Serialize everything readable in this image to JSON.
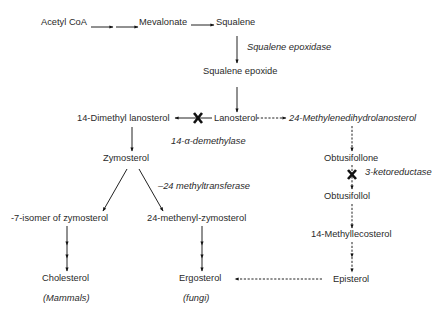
{
  "nodes": {
    "acetyl_coa": "Acetyl CoA",
    "mevalonate": "Mevalonate",
    "squalene": "Squalene",
    "squalene_epoxide": "Squalene epoxide",
    "lanosterol": "Lanosterol",
    "dimethyl_lanosterol": "14-Dimethyl lanosterol",
    "methylenedihydrolanosterol": "24-Methylenedihydrolanosterol",
    "zymosterol": "Zymosterol",
    "obtusifollone": "Obtusifollone",
    "obtusifollol": "Obtusifollol",
    "isomer_zymosterol": "-7-isomer of zymosterol",
    "methenyl_zymosterol": "24-methenyl-zymosterol",
    "methyllecosterol": "14-Methyllecosterol",
    "cholesterol": "Cholesterol",
    "ergosterol": "Ergosterol",
    "episterol": "Episterol"
  },
  "organisms": {
    "mammals": "(Mammals)",
    "fungi": "(fungi)"
  },
  "enzymes": {
    "squalene_epoxidase": "Squalene epoxidase",
    "demethylase": "14-α-demethylase",
    "methyltransferase": "–24 methyltransferase",
    "ketoreductase": "3-ketoreductase"
  },
  "edges": [
    {
      "from": "acetyl_coa",
      "to": "mevalonate",
      "style": "solid",
      "steps": 2
    },
    {
      "from": "mevalonate",
      "to": "squalene",
      "style": "solid"
    },
    {
      "from": "squalene",
      "to": "squalene_epoxide",
      "style": "solid",
      "enzyme": "squalene_epoxidase"
    },
    {
      "from": "squalene_epoxide",
      "to": "lanosterol",
      "style": "solid"
    },
    {
      "from": "lanosterol",
      "to": "dimethyl_lanosterol",
      "style": "solid",
      "enzyme": "demethylase",
      "blocked": true
    },
    {
      "from": "lanosterol",
      "to": "methylenedihydrolanosterol",
      "style": "dashed"
    },
    {
      "from": "dimethyl_lanosterol",
      "to": "zymosterol",
      "style": "solid"
    },
    {
      "from": "zymosterol",
      "to": "isomer_zymosterol",
      "style": "solid"
    },
    {
      "from": "zymosterol",
      "to": "methenyl_zymosterol",
      "style": "solid",
      "enzyme": "methyltransferase"
    },
    {
      "from": "isomer_zymosterol",
      "to": "cholesterol",
      "style": "solid",
      "steps": 3
    },
    {
      "from": "methenyl_zymosterol",
      "to": "ergosterol",
      "style": "solid",
      "steps": 3
    },
    {
      "from": "methylenedihydrolanosterol",
      "to": "obtusifollone",
      "style": "dashed"
    },
    {
      "from": "obtusifollone",
      "to": "obtusifollol",
      "style": "dashed",
      "enzyme": "ketoreductase",
      "blocked": true
    },
    {
      "from": "obtusifollol",
      "to": "methyllecosterol",
      "style": "dashed"
    },
    {
      "from": "methyllecosterol",
      "to": "episterol",
      "style": "dashed",
      "steps": 2
    },
    {
      "from": "episterol",
      "to": "ergosterol",
      "style": "dashed"
    }
  ]
}
